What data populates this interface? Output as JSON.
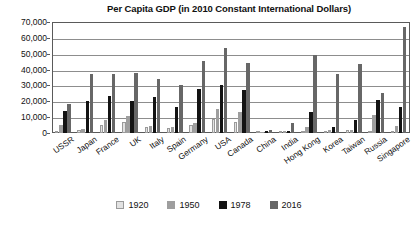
{
  "chart_data": {
    "type": "bar",
    "title": "Per Capita GDP (in 2010 Constant International Dollars)",
    "xlabel": "",
    "ylabel": "",
    "ylim": [
      0,
      70000
    ],
    "ytick_step": 10000,
    "ytick_labels": [
      "0",
      "10,000",
      "20,000",
      "30,000",
      "40,000",
      "50,000",
      "60,000",
      "70,000"
    ],
    "ytick_values": [
      0,
      10000,
      20000,
      30000,
      40000,
      50000,
      60000,
      70000
    ],
    "grid": true,
    "legend_position": "bottom",
    "categories": [
      "USSR",
      "Japan",
      "France",
      "UK",
      "Italy",
      "Spain",
      "Germany",
      "USA",
      "Canada",
      "China",
      "India",
      "Hong Kong",
      "Korea",
      "Taiwan",
      "Russia",
      "Singapore"
    ],
    "series": [
      {
        "name": "1920",
        "color": "#e2e2e2",
        "values": [
          1400,
          1900,
          4900,
          6900,
          3700,
          3300,
          5300,
          9000,
          6700,
          900,
          900,
          0,
          1100,
          1600,
          0,
          0
        ]
      },
      {
        "name": "1950",
        "color": "#9e9e9e",
        "values": [
          5200,
          2400,
          7900,
          10600,
          4500,
          3700,
          6500,
          15300,
          13000,
          800,
          1000,
          3800,
          1700,
          2100,
          11200,
          4200
        ]
      },
      {
        "name": "1978",
        "color": "#131313",
        "values": [
          13700,
          20200,
          23300,
          20300,
          22400,
          16700,
          27600,
          30200,
          26900,
          1000,
          1100,
          13500,
          3800,
          8300,
          20800,
          16300
        ]
      },
      {
        "name": "2016",
        "color": "#676767",
        "values": [
          18600,
          37500,
          37300,
          37800,
          33800,
          30500,
          45300,
          53700,
          44400,
          1800,
          6500,
          49400,
          37500,
          43800,
          25000,
          67000
        ]
      }
    ]
  },
  "legend": {
    "items": [
      {
        "label": "1920"
      },
      {
        "label": "1950"
      },
      {
        "label": "1978"
      },
      {
        "label": "2016"
      }
    ]
  }
}
